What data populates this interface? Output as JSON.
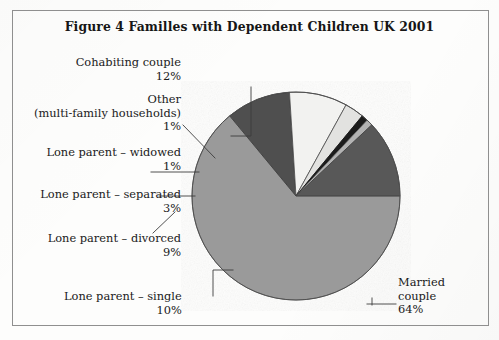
{
  "figure": {
    "title": "Figure 4  Familles with Dependent Children UK 2001"
  },
  "labels": {
    "cohabiting": {
      "name": "Cohabiting couple",
      "value": "12%"
    },
    "other": {
      "name_line1": "Other",
      "name_line2": "(multi-family households)",
      "value": "1%"
    },
    "widowed": {
      "name": "Lone parent – widowed",
      "value": "1%"
    },
    "separated": {
      "name": "Lone parent – separated",
      "value": "3%"
    },
    "divorced": {
      "name": "Lone parent – divorced",
      "value": "9%"
    },
    "single": {
      "name": "Lone parent – single",
      "value": "10%"
    },
    "married": {
      "name_line1": "Married",
      "name_line2": "couple",
      "value": "64%"
    }
  },
  "chart_data": {
    "type": "pie",
    "title": "Figure 4  Familles with Dependent Children UK 2001",
    "units": "percent",
    "total": 100,
    "start_angle_deg": 0,
    "direction": "clockwise",
    "legend": "none (direct labels with leader lines)",
    "categories": [
      "Married couple",
      "Lone parent – single",
      "Lone parent – divorced",
      "Lone parent – separated",
      "Lone parent – widowed",
      "Other (multi-family households)",
      "Cohabiting couple"
    ],
    "values": [
      64,
      10,
      9,
      3,
      1,
      1,
      12
    ],
    "value_labels": [
      "64%",
      "10%",
      "9%",
      "3%",
      "1%",
      "1%",
      "12%"
    ],
    "colors": [
      "#9a9a9a",
      "#4f4f4f",
      "#f2f2f0",
      "#e2e2e0",
      "#1c1c1c",
      "#b3b3b3",
      "#595959"
    ],
    "geometry": {
      "center_x": 296,
      "center_y": 196,
      "radius": 104
    }
  }
}
